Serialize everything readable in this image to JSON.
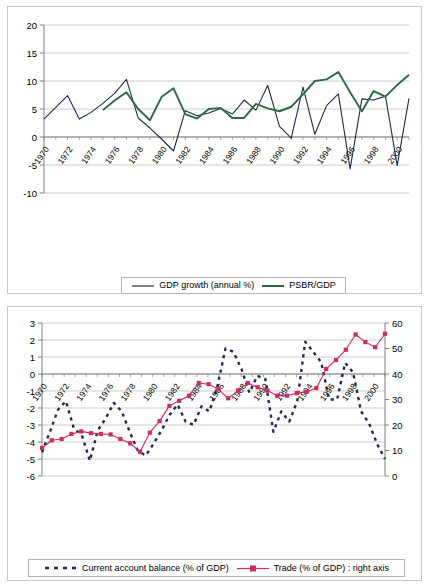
{
  "page": {
    "width": 429,
    "height": 587,
    "background": "#ffffff",
    "border_color": "#c8c8c8"
  },
  "colors": {
    "navy": "#1f2a52",
    "green": "#2d6b44",
    "pink": "#d12a5e",
    "grid": "#c0c0c0",
    "axis": "#808080",
    "text": "#000000"
  },
  "chart_data": [
    {
      "id": "top",
      "type": "line",
      "title": "",
      "xlabel": "",
      "ylabel": "",
      "ylim": [
        -10,
        20
      ],
      "yticks": [
        20,
        15,
        10,
        5,
        0,
        -5,
        -10
      ],
      "grid": true,
      "legend_position": "bottom",
      "x": [
        1970,
        1971,
        1972,
        1973,
        1974,
        1975,
        1976,
        1977,
        1978,
        1979,
        1980,
        1981,
        1982,
        1983,
        1984,
        1985,
        1986,
        1987,
        1988,
        1989,
        1990,
        1991,
        1992,
        1993,
        1994,
        1995,
        1996,
        1997,
        1998,
        1999,
        2000,
        2001
      ],
      "xticks": [
        1970,
        1972,
        1974,
        1976,
        1978,
        1980,
        1982,
        1984,
        1986,
        1988,
        1990,
        1992,
        1994,
        1996,
        1998,
        2000
      ],
      "xticklabels": [
        "1970",
        "1972",
        "1974",
        "1976",
        "1978",
        "1980",
        "1982",
        "1984",
        "1986",
        "1988",
        "1990",
        "1992",
        "1994",
        "1996",
        "1998",
        "2000"
      ],
      "series": [
        {
          "name": "GDP growth (annual %)",
          "color": "#1f2a52",
          "style": "solid",
          "marker": "none",
          "values": [
            3.2,
            5.3,
            7.4,
            3.2,
            4.4,
            6.0,
            7.8,
            10.3,
            3.4,
            1.6,
            -0.4,
            -2.5,
            4.7,
            3.8,
            4.3,
            5.1,
            4.1,
            6.6,
            4.8,
            9.2,
            1.9,
            -0.2,
            8.9,
            0.5,
            5.6,
            7.7,
            -5.7,
            6.8,
            6.6,
            7.3,
            -5.1,
            6.9
          ]
        },
        {
          "name": "PSBR/GDP",
          "color": "#2d6b44",
          "style": "solid",
          "marker": "none",
          "values": [
            null,
            null,
            null,
            null,
            null,
            4.8,
            6.5,
            8.0,
            5.0,
            3.0,
            7.2,
            8.7,
            4.1,
            3.3,
            5.0,
            5.2,
            3.4,
            3.4,
            5.9,
            5.1,
            4.6,
            5.4,
            7.6,
            10.0,
            10.3,
            11.6,
            8.0,
            4.6,
            8.2,
            7.2,
            9.3,
            11.1
          ]
        }
      ]
    },
    {
      "id": "bottom",
      "type": "line",
      "title": "",
      "xlabel": "",
      "ylabel": "",
      "ylim": [
        -6,
        3
      ],
      "yticks": [
        3,
        2,
        1,
        0,
        -1,
        -2,
        -3,
        -4,
        -5,
        -6
      ],
      "y2lim": [
        0,
        60
      ],
      "y2ticks": [
        60,
        50,
        40,
        30,
        20,
        10,
        0
      ],
      "grid": true,
      "legend_position": "bottom",
      "x": [
        1970,
        1971,
        1972,
        1973,
        1974,
        1975,
        1976,
        1977,
        1978,
        1979,
        1980,
        1981,
        1982,
        1983,
        1984,
        1985,
        1986,
        1987,
        1988,
        1989,
        1990,
        1991,
        1992,
        1993,
        1994,
        1995,
        1996,
        1997,
        1998,
        1999,
        2000,
        2001
      ],
      "xticks": [
        1970,
        1972,
        1974,
        1976,
        1978,
        1980,
        1982,
        1984,
        1986,
        1988,
        1990,
        1992,
        1994,
        1996,
        1998,
        2000
      ],
      "xticklabels": [
        "1970",
        "1972",
        "1974",
        "1976",
        "1978",
        "1980",
        "1982",
        "1984",
        "1986",
        "1988",
        "1990",
        "1992",
        "1994",
        "1996",
        "1998",
        "2000"
      ],
      "series": [
        {
          "name": "Current account balance (% of GDP)",
          "color": "#1f2a52",
          "style": "dashed",
          "marker": "none",
          "axis": "left",
          "values": [
            -4.6,
            -3.4,
            -2.1,
            -1.6,
            -3.2,
            -3.6,
            -5.1,
            -3.3,
            -2.6,
            -1.7,
            -2.2,
            -3.4,
            -4.5,
            -4.8,
            -4.1,
            -3.3,
            -2.4,
            -1.8,
            -2.8,
            -3.0,
            -1.9,
            -2.2,
            -0.7,
            1.5,
            1.3,
            0.3,
            -1.1,
            -0.1,
            -0.3,
            -3.4,
            -2.2,
            -2.8,
            -1.6,
            1.9,
            1.3,
            0.7,
            -1.5,
            -1.5,
            0.65,
            0.1,
            -2.2,
            -2.9,
            -4.1,
            -5.0
          ]
        },
        {
          "name": "Trade (% of GDP) : right axis",
          "color": "#d12a5e",
          "style": "solid",
          "marker": "square",
          "axis": "right",
          "values": [
            11,
            14,
            14.5,
            16.5,
            17.5,
            16.8,
            16.5,
            16.3,
            14.5,
            12.8,
            9.5,
            17.0,
            21.5,
            27.5,
            29.5,
            31.5,
            36.5,
            36.0,
            34.0,
            30.5,
            33.5,
            36.5,
            34.8,
            33.5,
            31.5,
            31.5,
            32.5,
            33.0,
            34.5,
            42.0,
            45.5,
            49.5,
            55.5,
            52.5,
            50.5,
            55.8
          ]
        }
      ]
    }
  ],
  "legends": {
    "top": {
      "items": [
        {
          "label": "GDP growth (annual %)",
          "color": "#1f2a52",
          "style": "solid"
        },
        {
          "label": "PSBR/GDP",
          "color": "#2d6b44",
          "style": "solid"
        }
      ]
    },
    "bottom": {
      "items": [
        {
          "label": "Current account balance (% of GDP)",
          "color": "#1f2a52",
          "style": "dashed"
        },
        {
          "label": "Trade (% of GDP) : right axis",
          "color": "#d12a5e",
          "style": "solid-marker"
        }
      ]
    }
  }
}
